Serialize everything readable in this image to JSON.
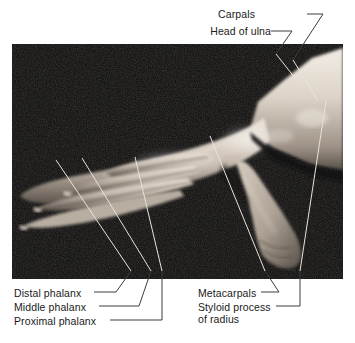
{
  "figure": {
    "kind": "anatomical-photograph-with-leader-labels",
    "background_color": "#ffffff",
    "photo": {
      "name": "hand-photograph",
      "description": "Black-and-white photograph of a hand in lateral/dorsal view, fingers extended toward the left, thumb directed downward, wrist and forearm entering at the right",
      "x": 12,
      "y": 44,
      "width": 331,
      "height": 235,
      "background_color": "#0b0a09",
      "skin_highlight": "#f2ece4",
      "skin_midtone": "#b9ada1",
      "skin_shadow": "#5d554d"
    },
    "leader_line_color_on_photo": "#e8e4dc",
    "leader_line_color_on_page": "#3c3c3c",
    "text_color": "#1a1a1a"
  },
  "labels": {
    "top": [
      {
        "id": "carpals",
        "text": "Carpals",
        "text_x": 255,
        "text_y": 8,
        "align": "right",
        "leader": "M307,14 L323,14 L293,60"
      },
      {
        "id": "head-of-ulna",
        "text": "Head of ulna",
        "text_x": 198,
        "text_y": 25,
        "align": "right",
        "leader": "M271,31 L292,31 L276,54"
      }
    ],
    "bottom_left": [
      {
        "id": "distal-phalanx",
        "text": "Distal phalanx",
        "text_x": 14,
        "text_y": 287,
        "align": "left",
        "leader": "M94,292 L116,292 L131,271"
      },
      {
        "id": "middle-phalanx",
        "text": "Middle phalanx",
        "text_x": 14,
        "text_y": 301,
        "align": "left",
        "leader": "M99,306 L139,306 L151,271"
      },
      {
        "id": "proximal-phalanx",
        "text": "Proximal phalanx",
        "text_x": 14,
        "text_y": 315,
        "align": "left",
        "leader": "M110,320 L162,320 L162,271"
      }
    ],
    "bottom_right": [
      {
        "id": "metacarpals",
        "text": "Metacarpals",
        "text_x": 198,
        "text_y": 287,
        "align": "left",
        "leader": "M261,292 L279,292 L265,271"
      },
      {
        "id": "styloid-process-of-radius",
        "text": "Styloid process",
        "text_line2": "of radius",
        "text_x": 198,
        "text_y": 301,
        "align": "left",
        "leader": "M276,306 L300,306 L300,271"
      }
    ]
  },
  "photo_leader_lines": [
    {
      "id": "carpals-in-photo",
      "path": "M293,60 L318,101"
    },
    {
      "id": "head-of-ulna-in-photo",
      "path": "M276,54 L299,83"
    },
    {
      "id": "distal-phalanx-in-photo",
      "path": "M131,271 L56,160"
    },
    {
      "id": "middle-phalanx-in-photo",
      "path": "M151,271 L82,158"
    },
    {
      "id": "proximal-phalanx-in-photo",
      "path": "M162,271 L135,157"
    },
    {
      "id": "metacarpals-in-photo",
      "path": "M265,271 L210,136"
    },
    {
      "id": "styloid-in-photo",
      "path": "M300,271 L326,101"
    }
  ]
}
